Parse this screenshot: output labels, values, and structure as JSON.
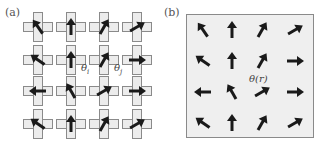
{
  "panel_a": {
    "label": "(a)",
    "theta_i": "θi",
    "theta_j": "θj",
    "grid_rows": 4,
    "grid_cols": 4,
    "arrow_angles_deg": [
      [
        -35,
        0,
        30,
        60
      ],
      [
        -55,
        0,
        30,
        90
      ],
      [
        -90,
        -30,
        60,
        90
      ],
      [
        -55,
        0,
        30,
        60
      ]
    ]
  },
  "panel_b": {
    "label": "(b)",
    "field_label": "θ(r)",
    "arrow_angles_deg": [
      [
        -35,
        0,
        30,
        60
      ],
      [
        -55,
        0,
        30,
        90
      ],
      [
        -90,
        -30,
        60,
        90
      ],
      [
        -55,
        0,
        30,
        60
      ]
    ]
  },
  "colors": {
    "cross_fill": "#ececec",
    "cross_border": "#8a8a8a",
    "arrow": "#1a1a1a",
    "box_fill": "#efefef"
  }
}
